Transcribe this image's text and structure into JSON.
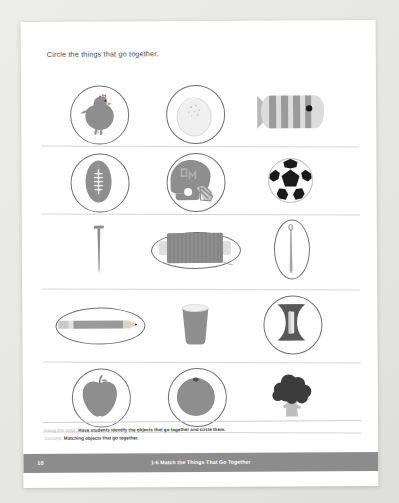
{
  "worksheet": {
    "title": "Circle the things that go together.",
    "rows": [
      {
        "row_index": 1,
        "cells": [
          {
            "object": "chicken",
            "circled": true,
            "mark_shape": "round"
          },
          {
            "object": "egg",
            "circled": true,
            "mark_shape": "round"
          },
          {
            "object": "fish",
            "circled": false,
            "mark_shape": "none"
          }
        ]
      },
      {
        "row_index": 2,
        "cells": [
          {
            "object": "football",
            "circled": true,
            "mark_shape": "round"
          },
          {
            "object": "football-helmet",
            "circled": true,
            "mark_shape": "round"
          },
          {
            "object": "soccer-ball",
            "circled": false,
            "mark_shape": "none"
          }
        ]
      },
      {
        "row_index": 3,
        "cells": [
          {
            "object": "nail",
            "circled": false,
            "mark_shape": "none"
          },
          {
            "object": "thread-spool",
            "circled": true,
            "mark_shape": "wide"
          },
          {
            "object": "sewing-needle",
            "circled": true,
            "mark_shape": "tall"
          }
        ]
      },
      {
        "row_index": 4,
        "cells": [
          {
            "object": "pencil",
            "circled": true,
            "mark_shape": "wide"
          },
          {
            "object": "cup",
            "circled": false,
            "mark_shape": "none"
          },
          {
            "object": "pencil-sharpener",
            "circled": true,
            "mark_shape": "round"
          }
        ]
      },
      {
        "row_index": 5,
        "cells": [
          {
            "object": "apple",
            "circled": true,
            "mark_shape": "round"
          },
          {
            "object": "orange",
            "circled": true,
            "mark_shape": "round"
          },
          {
            "object": "broccoli",
            "circled": false,
            "mark_shape": "none"
          }
        ]
      }
    ]
  },
  "teacher_note": {
    "using_label": "Using this page:",
    "using_text": "Have students identify the objects that go together and circle them.",
    "concept_label": "Concept:",
    "concept_text": "Matching objects that go together."
  },
  "footer": {
    "page_number": "10",
    "lesson_title": "1-5 Match the Things That Go Together"
  },
  "colors": {
    "page": "#ffffff",
    "backdrop": "#e8e8e6",
    "footer_bar": "#8c8c8c",
    "mark_stroke": "#6f6f72",
    "rule_line": "#d6d6d6",
    "art_mid_gray": "#8e8e8e",
    "art_light_gray": "#d8d8d8",
    "art_dark_gray": "#5a5a5a",
    "accent_red": "#b85a55"
  }
}
